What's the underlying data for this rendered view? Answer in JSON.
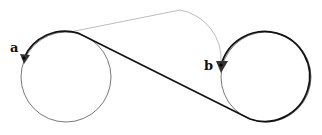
{
  "diagram": {
    "type": "dubins-path",
    "labels": {
      "start": "a",
      "end": "b"
    },
    "colors": {
      "primary_path": "#111111",
      "alternate_path": "#b5b5b5",
      "circle": "#555555",
      "marker": "#222222"
    },
    "circles": [
      {
        "id": "left-turn-circle",
        "cx": 66,
        "cy": 77,
        "r": 45
      },
      {
        "id": "right-turn-circle",
        "cx": 266,
        "cy": 77,
        "r": 45
      }
    ],
    "points": {
      "a": {
        "x": 24,
        "y": 58
      },
      "b": {
        "x": 221,
        "y": 65
      }
    }
  }
}
